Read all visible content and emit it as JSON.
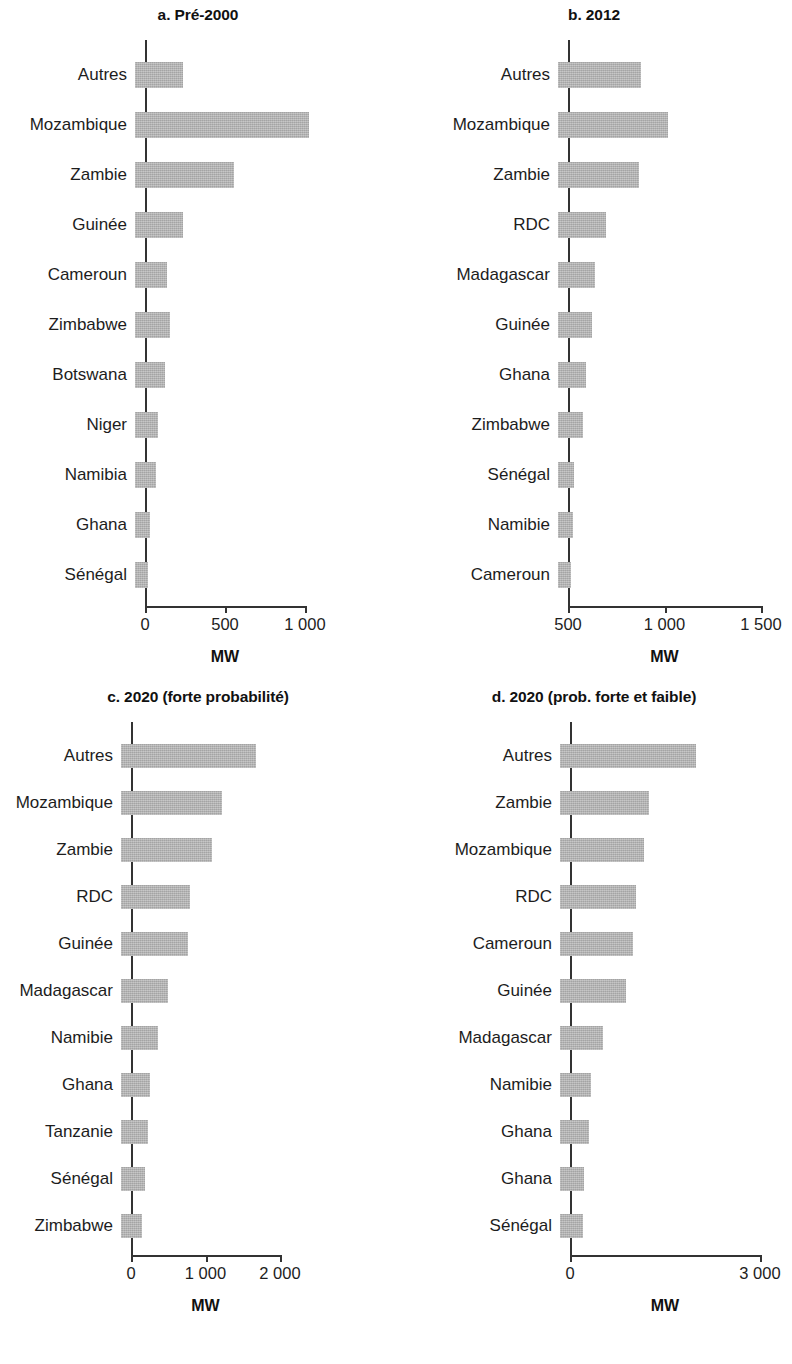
{
  "figure": {
    "bar_color": "#b4b4b4",
    "axis_color": "#333333",
    "text_color": "#1d1d1d"
  },
  "chart_data": [
    {
      "type": "bar",
      "orientation": "horizontal",
      "panel_id": "a",
      "title": "a. Pré-2000",
      "xlabel": "MW",
      "ylabel": "",
      "xlim": [
        0,
        1150
      ],
      "ticks": [
        0,
        500,
        1000
      ],
      "tick_labels": [
        "0",
        "500",
        "1 000"
      ],
      "grid": false,
      "legend": "none",
      "categories": [
        "Autres",
        "Mozambique",
        "Zambie",
        "Guinée",
        "Cameroun",
        "Zimbabwe",
        "Botswana",
        "Niger",
        "Namibia",
        "Ghana",
        "Sénégal"
      ],
      "values": [
        300,
        1090,
        620,
        300,
        200,
        220,
        190,
        145,
        130,
        95,
        80
      ]
    },
    {
      "type": "bar",
      "orientation": "horizontal",
      "panel_id": "b",
      "title": "b. 2012",
      "xlabel": "MW",
      "ylabel": "",
      "xlim": [
        500,
        1550
      ],
      "ticks": [
        500,
        1000,
        1500
      ],
      "tick_labels": [
        "500",
        "1 000",
        "1 500"
      ],
      "grid": false,
      "legend": "none",
      "categories": [
        "Autres",
        "Mozambique",
        "Zambie",
        "RDC",
        "Madagascar",
        "Guinée",
        "Ghana",
        "Zimbabwe",
        "Sénégal",
        "Namibie",
        "Cameroun"
      ],
      "values": [
        930,
        1070,
        920,
        750,
        690,
        675,
        645,
        630,
        585,
        580,
        565
      ]
    },
    {
      "type": "bar",
      "orientation": "horizontal",
      "panel_id": "c",
      "title": "c. 2020 (forte probabilité)",
      "xlabel": "MW",
      "ylabel": "",
      "xlim": [
        0,
        2150
      ],
      "ticks": [
        0,
        1000,
        2000
      ],
      "tick_labels": [
        "0",
        "1 000",
        "2 000"
      ],
      "grid": false,
      "legend": "none",
      "categories": [
        "Autres",
        "Mozambique",
        "Zambie",
        "RDC",
        "Guinée",
        "Madagascar",
        "Namibie",
        "Ghana",
        "Tanzanie",
        "Sénégal",
        "Zimbabwe"
      ],
      "values": [
        1810,
        1350,
        1220,
        920,
        895,
        630,
        500,
        390,
        360,
        325,
        280
      ]
    },
    {
      "type": "bar",
      "orientation": "horizontal",
      "panel_id": "d",
      "title": "d. 2020 (prob. forte et faible)",
      "xlabel": "MW",
      "ylabel": "",
      "xlim": [
        0,
        3150
      ],
      "ticks": [
        0,
        3000
      ],
      "tick_labels": [
        "0",
        "3 000"
      ],
      "grid": false,
      "legend": "none",
      "categories": [
        "Autres",
        "Zambie",
        "Mozambique",
        "RDC",
        "Cameroun",
        "Guinée",
        "Madagascar",
        "Namibie",
        "Ghana",
        "Ghana",
        "Sénégal"
      ],
      "values": [
        2150,
        1400,
        1330,
        1200,
        1150,
        1040,
        680,
        490,
        460,
        380,
        360
      ]
    }
  ]
}
